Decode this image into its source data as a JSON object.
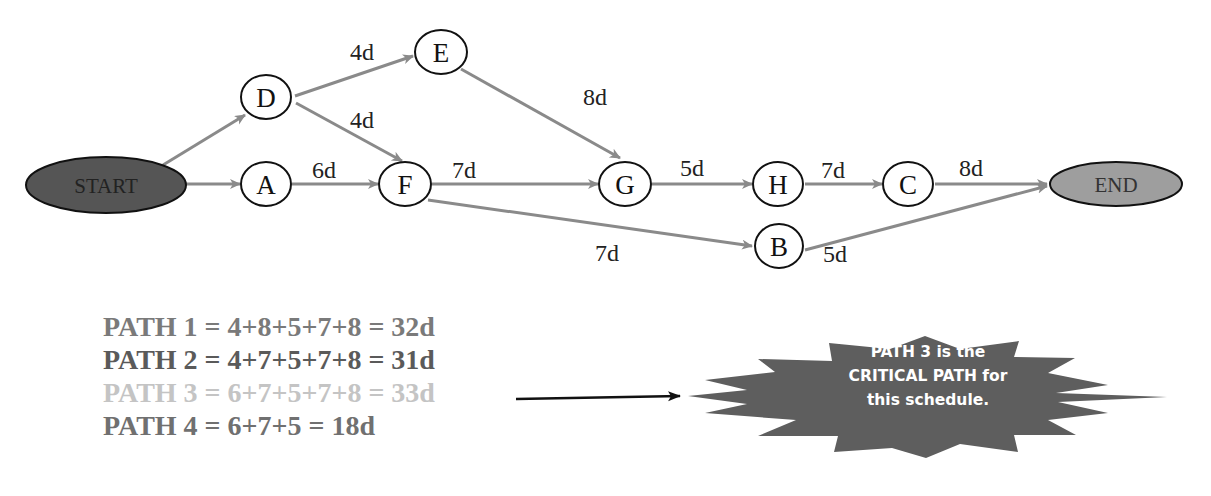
{
  "colors": {
    "edge": "#8a8a8a",
    "node_stroke": "#111111",
    "start_fill": "#555555",
    "end_fill": "#9e9e9e",
    "callout_fill": "#5e5e5e",
    "path1": "#7a7a7a",
    "path2": "#5a5a5a",
    "path3": "#c4c4c4",
    "path4": "#707070"
  },
  "diagram": {
    "start_label": "START",
    "end_label": "END",
    "nodes": [
      {
        "id": "D",
        "label": "D"
      },
      {
        "id": "A",
        "label": "A"
      },
      {
        "id": "E",
        "label": "E"
      },
      {
        "id": "F",
        "label": "F"
      },
      {
        "id": "G",
        "label": "G"
      },
      {
        "id": "H",
        "label": "H"
      },
      {
        "id": "C",
        "label": "C"
      },
      {
        "id": "B",
        "label": "B"
      }
    ],
    "edges": [
      {
        "from": "START",
        "to": "D",
        "label": ""
      },
      {
        "from": "START",
        "to": "A",
        "label": ""
      },
      {
        "from": "D",
        "to": "E",
        "label": "4d"
      },
      {
        "from": "D",
        "to": "F",
        "label": "4d"
      },
      {
        "from": "A",
        "to": "F",
        "label": "6d"
      },
      {
        "from": "E",
        "to": "G",
        "label": "8d"
      },
      {
        "from": "F",
        "to": "G",
        "label": "7d"
      },
      {
        "from": "F",
        "to": "B",
        "label": "7d"
      },
      {
        "from": "G",
        "to": "H",
        "label": "5d"
      },
      {
        "from": "H",
        "to": "C",
        "label": "7d"
      },
      {
        "from": "C",
        "to": "END",
        "label": "8d"
      },
      {
        "from": "B",
        "to": "END",
        "label": "5d"
      }
    ]
  },
  "paths": [
    {
      "text": "PATH 1 = 4+8+5+7+8 = 32d"
    },
    {
      "text": "PATH 2 = 4+7+5+7+8 = 31d"
    },
    {
      "text": "PATH 3 = 6+7+5+7+8 = 33d"
    },
    {
      "text": "PATH 4 = 6+7+5 = 18d"
    }
  ],
  "callout": {
    "line1": "PATH 3 is the",
    "line2": "CRITICAL PATH for",
    "line3": "this schedule."
  }
}
